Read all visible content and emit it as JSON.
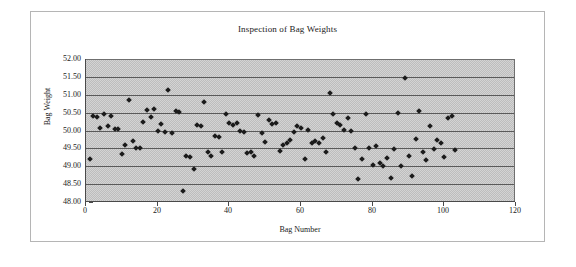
{
  "chart_data": {
    "type": "scatter",
    "title": "Inspection of Bag Weights",
    "xlabel": "Bag Number",
    "ylabel": "Bag Weight",
    "xlim": [
      0,
      120
    ],
    "ylim": [
      48.0,
      52.0
    ],
    "xticks": [
      0,
      20,
      40,
      60,
      80,
      100,
      120
    ],
    "xtick_labels": [
      "0",
      "20",
      "40",
      "60",
      "80",
      "100",
      "120"
    ],
    "yticks": [
      48.0,
      48.5,
      49.0,
      49.5,
      50.0,
      50.5,
      51.0,
      51.5,
      52.0
    ],
    "ytick_labels": [
      "48.00",
      "48.50",
      "49.00",
      "49.50",
      "50.00",
      "50.50",
      "51.00",
      "51.50",
      "52.00"
    ],
    "grid": "horizontal",
    "legend": null,
    "plot_background": "#bdbdbd",
    "marker_color": "#1b1b1b",
    "marker_shape": "diamond",
    "series": [
      {
        "name": "Bag Weight",
        "points": [
          [
            1,
            49.21
          ],
          [
            2,
            50.4
          ],
          [
            3,
            50.38
          ],
          [
            4,
            50.08
          ],
          [
            5,
            50.46
          ],
          [
            6,
            50.12
          ],
          [
            7,
            50.41
          ],
          [
            8,
            50.05
          ],
          [
            9,
            50.03
          ],
          [
            10,
            49.35
          ],
          [
            11,
            49.59
          ],
          [
            12,
            50.86
          ],
          [
            13,
            49.7
          ],
          [
            14,
            49.52
          ],
          [
            15,
            49.5
          ],
          [
            16,
            50.23
          ],
          [
            17,
            50.58
          ],
          [
            18,
            50.39
          ],
          [
            19,
            50.6
          ],
          [
            20,
            50.0
          ],
          [
            21,
            50.19
          ],
          [
            22,
            49.96
          ],
          [
            23,
            51.14
          ],
          [
            24,
            49.93
          ],
          [
            25,
            50.55
          ],
          [
            26,
            50.51
          ],
          [
            27,
            48.32
          ],
          [
            28,
            49.3
          ],
          [
            29,
            49.26
          ],
          [
            30,
            48.93
          ],
          [
            31,
            50.15
          ],
          [
            32,
            50.12
          ],
          [
            33,
            50.8
          ],
          [
            34,
            49.4
          ],
          [
            35,
            49.3
          ],
          [
            36,
            49.85
          ],
          [
            37,
            49.82
          ],
          [
            38,
            49.41
          ],
          [
            39,
            50.47
          ],
          [
            40,
            50.2
          ],
          [
            41,
            50.15
          ],
          [
            42,
            50.22
          ],
          [
            43,
            49.99
          ],
          [
            44,
            49.97
          ],
          [
            45,
            49.36
          ],
          [
            46,
            49.41
          ],
          [
            47,
            49.29
          ],
          [
            48,
            50.44
          ],
          [
            49,
            49.93
          ],
          [
            50,
            49.68
          ],
          [
            51,
            50.3
          ],
          [
            52,
            50.17
          ],
          [
            53,
            50.21
          ],
          [
            54,
            49.44
          ],
          [
            55,
            49.6
          ],
          [
            56,
            49.66
          ],
          [
            57,
            49.73
          ],
          [
            58,
            49.95
          ],
          [
            59,
            50.13
          ],
          [
            60,
            50.08
          ],
          [
            61,
            49.2
          ],
          [
            62,
            50.02
          ],
          [
            63,
            49.64
          ],
          [
            64,
            49.7
          ],
          [
            65,
            49.65
          ],
          [
            66,
            49.8
          ],
          [
            67,
            49.4
          ],
          [
            68,
            51.06
          ],
          [
            69,
            50.45
          ],
          [
            70,
            50.2
          ],
          [
            71,
            50.15
          ],
          [
            72,
            50.02
          ],
          [
            73,
            50.35
          ],
          [
            74,
            50.0
          ],
          [
            75,
            49.51
          ],
          [
            76,
            48.64
          ],
          [
            77,
            49.2
          ],
          [
            78,
            50.46
          ],
          [
            79,
            49.5
          ],
          [
            80,
            49.05
          ],
          [
            81,
            49.57
          ],
          [
            82,
            49.1
          ],
          [
            83,
            49.02
          ],
          [
            84,
            49.24
          ],
          [
            85,
            48.66
          ],
          [
            86,
            49.47
          ],
          [
            87,
            50.49
          ],
          [
            88,
            49.0
          ],
          [
            89,
            51.46
          ],
          [
            90,
            49.29
          ],
          [
            91,
            48.72
          ],
          [
            92,
            49.76
          ],
          [
            93,
            50.55
          ],
          [
            94,
            49.41
          ],
          [
            95,
            49.17
          ],
          [
            96,
            50.13
          ],
          [
            97,
            49.47
          ],
          [
            98,
            49.73
          ],
          [
            99,
            49.66
          ],
          [
            100,
            49.25
          ],
          [
            101,
            50.36
          ],
          [
            102,
            50.4
          ],
          [
            103,
            49.45
          ]
        ]
      }
    ]
  }
}
